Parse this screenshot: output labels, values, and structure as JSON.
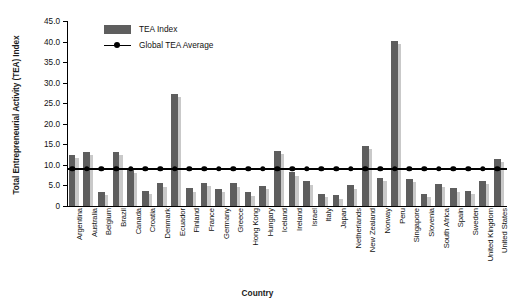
{
  "chart_data": {
    "type": "bar",
    "title": "",
    "xlabel": "Country",
    "ylabel": "Total Entrepreneurial Activity (TEA) Index",
    "ylim": [
      0,
      45
    ],
    "ytick_labels": [
      "0",
      "5.0",
      "10.0",
      "15.0",
      "20.0",
      "25.0",
      "30.0",
      "35.0",
      "40.0",
      "45.0"
    ],
    "ytick_values": [
      0,
      5,
      10,
      15,
      20,
      25,
      30,
      35,
      40,
      45
    ],
    "grid": false,
    "legend_position": "top-left",
    "legend": [
      "TEA Index",
      "Global TEA Average"
    ],
    "global_average": 9.0,
    "categories": [
      "Argentina",
      "Australia",
      "Belgium",
      "Brazil",
      "Canada",
      "Croatia",
      "Denmark",
      "Ecuador",
      "Finland",
      "France",
      "Germany",
      "Greece",
      "Hong Kong",
      "Hungary",
      "Iceland",
      "Ireland",
      "Israel",
      "Italy",
      "Japan",
      "Netherlands",
      "New Zealand",
      "Norway",
      "Peru",
      "Singapore",
      "Slovenia",
      "South Africa",
      "Spain",
      "Sweden",
      "United Kingdom",
      "United States"
    ],
    "series": [
      {
        "name": "TEA Index",
        "color": "#5e5e5e",
        "values": [
          12.5,
          13.2,
          3.5,
          13.2,
          8.8,
          3.6,
          5.5,
          27.2,
          4.3,
          5.6,
          4.2,
          5.5,
          3.3,
          4.8,
          13.4,
          8.2,
          6.0,
          3.0,
          2.6,
          5.0,
          14.7,
          6.8,
          40.2,
          6.5,
          3.0,
          5.3,
          4.3,
          3.6,
          6.2,
          11.5
        ]
      }
    ],
    "series_shadow_color": "#c9c9c9"
  },
  "axis": {
    "y_title": "Total Entrepreneurial Activity (TEA) Index",
    "x_title": "Country"
  },
  "legend": {
    "bar_label": "TEA Index",
    "line_label": "Global TEA Average"
  }
}
